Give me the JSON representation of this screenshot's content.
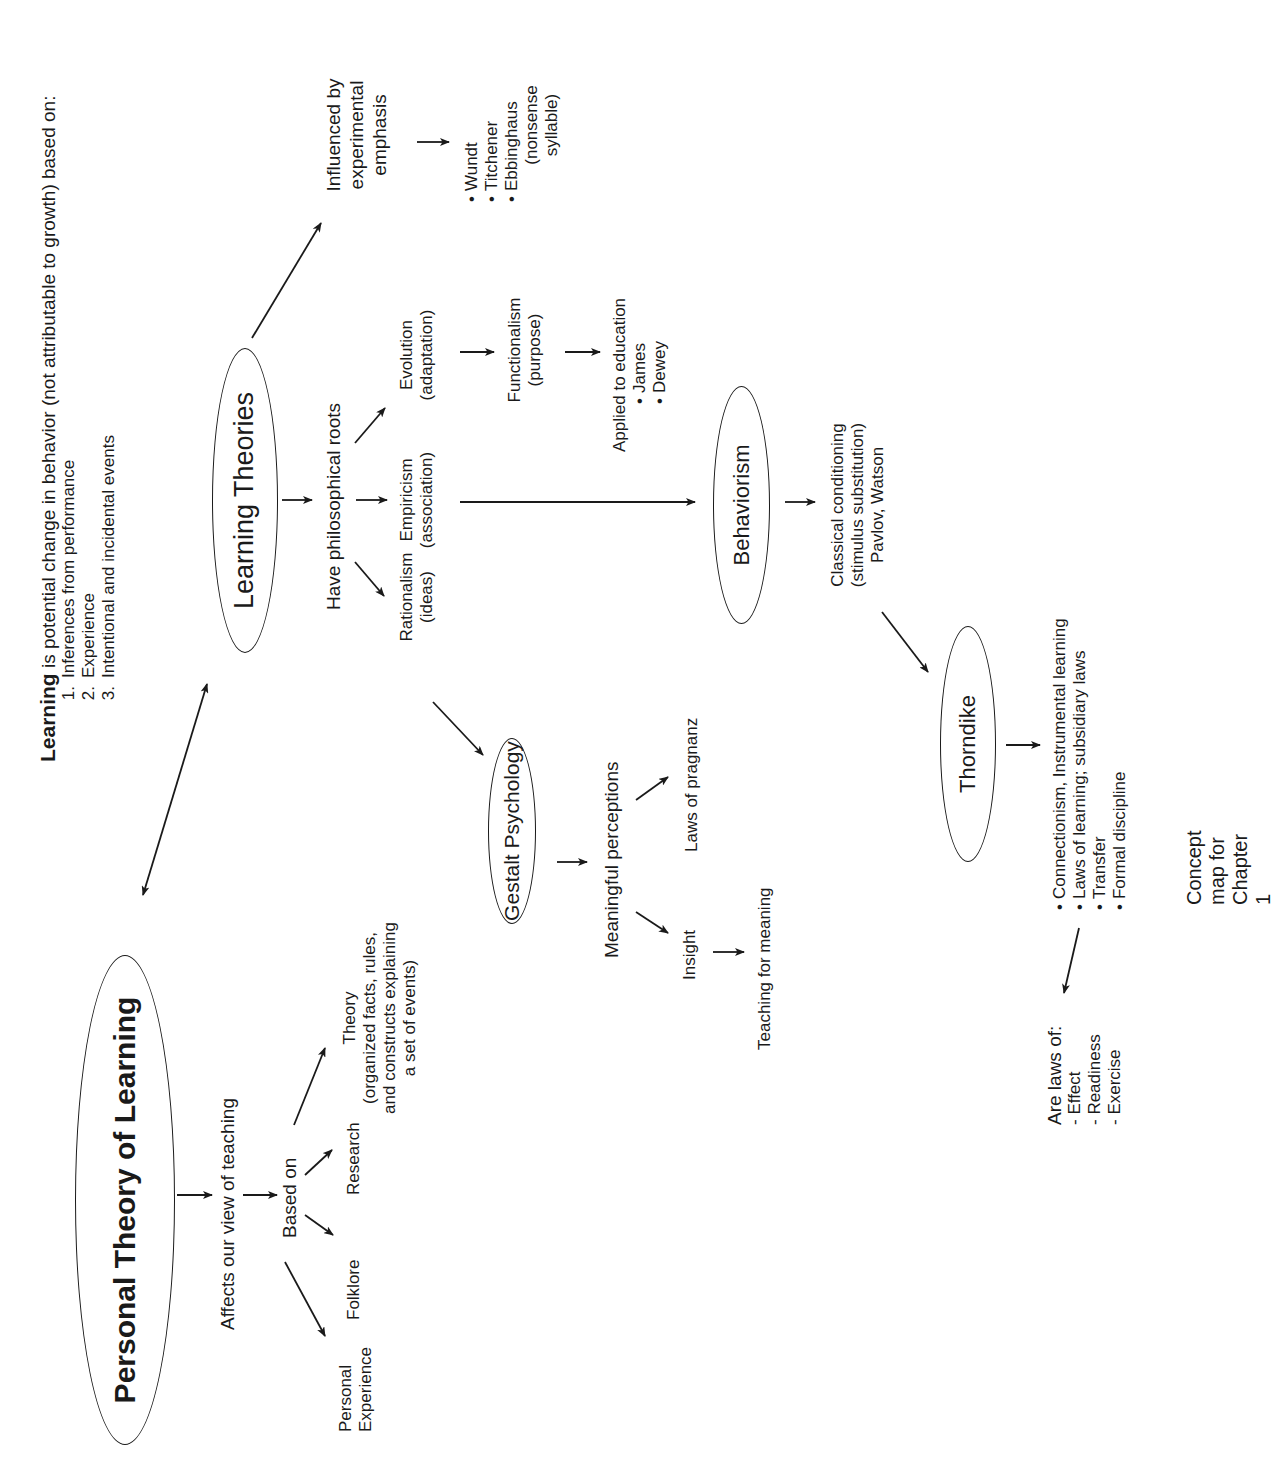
{
  "definition": {
    "term": "Learning",
    "text": " is potential change in behavior (not attributable to growth) based on:",
    "items": [
      {
        "num": "1.",
        "label": "Inferences from performance"
      },
      {
        "num": "2.",
        "label": "Experience"
      },
      {
        "num": "3.",
        "label": "Intentional and incidental events"
      }
    ]
  },
  "nodes": {
    "personal_theory": "Personal Theory of Learning",
    "learning_theories": "Learning Theories",
    "gestalt": "Gestalt Psychology",
    "behaviorism": "Behaviorism",
    "thorndike": "Thorndike"
  },
  "labels": {
    "affects": "Affects our view of teaching",
    "based_on": "Based on",
    "personal_experience": [
      "Personal",
      "Experience"
    ],
    "folklore": "Folklore",
    "research": "Research",
    "theory": [
      "Theory",
      "(organized facts, rules,",
      "and constructs explaining",
      "a set of events)"
    ],
    "have_roots": "Have philosophical roots",
    "rationalism": [
      "Rationalism",
      "(ideas)"
    ],
    "empiricism": [
      "Empiricism",
      "(association)"
    ],
    "evolution": [
      "Evolution",
      "(adaptation)"
    ],
    "influenced": [
      "Influenced by",
      "experimental",
      "emphasis"
    ],
    "experimentalists": [
      "Wundt",
      "Titchener",
      "Ebbinghaus"
    ],
    "ebbinghaus_note": [
      "(nonsense",
      "syllable)"
    ],
    "functionalism": [
      "Functionalism",
      "(purpose)"
    ],
    "applied": "Applied to education",
    "applied_people": [
      "James",
      "Dewey"
    ],
    "meaningful": "Meaningful perceptions",
    "pragnanz": "Laws of pragnanz",
    "insight": "Insight",
    "teaching_meaning": "Teaching for meaning",
    "classical": [
      "Classical conditioning",
      "(stimulus substitution)",
      "Pavlov, Watson"
    ],
    "thorndike_items": [
      "Connectionism, Instrumental learning",
      "Laws of learning; subsidiary laws",
      "Transfer",
      "Formal discipline"
    ],
    "laws_of": [
      "Are laws of:",
      "- Effect",
      "- Readiness",
      "- Exercise"
    ]
  },
  "caption": "Concept map for Chapter 1"
}
